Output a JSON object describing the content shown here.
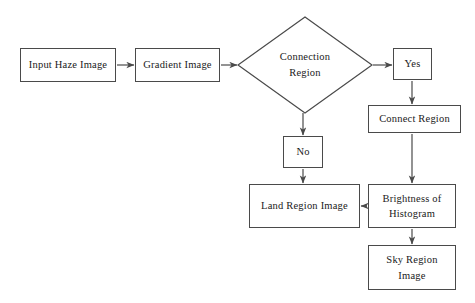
{
  "diagram": {
    "stroke_color": "#4a4a4a",
    "text_color": "#1a1a1a",
    "background_color": "#ffffff",
    "nodes": [
      {
        "id": "input_haze_image",
        "label": "Input Haze Image",
        "shape": "rect",
        "x": 20,
        "y": 48,
        "w": 96,
        "h": 34
      },
      {
        "id": "gradient_image",
        "label": "Gradient Image",
        "shape": "rect",
        "x": 135,
        "y": 48,
        "w": 85,
        "h": 34
      },
      {
        "id": "connection_region",
        "label": "Connection\nRegion",
        "shape": "diamond",
        "x": 238,
        "y": 17,
        "w": 134,
        "h": 96
      },
      {
        "id": "yes",
        "label": "Yes",
        "shape": "rect",
        "x": 393,
        "y": 48,
        "w": 39,
        "h": 32
      },
      {
        "id": "no",
        "label": "No",
        "shape": "rect",
        "x": 283,
        "y": 136,
        "w": 40,
        "h": 32
      },
      {
        "id": "connect_region",
        "label": "Connect Region",
        "shape": "rect",
        "x": 368,
        "y": 105,
        "w": 93,
        "h": 28
      },
      {
        "id": "land_region_image",
        "label": "Land Region Image",
        "shape": "rect",
        "x": 249,
        "y": 184,
        "w": 111,
        "h": 44
      },
      {
        "id": "brightness_of_histogram",
        "label": "Brightness of\nHistogram",
        "shape": "rect",
        "x": 368,
        "y": 184,
        "w": 88,
        "h": 44
      },
      {
        "id": "sky_region_image",
        "label": "Sky Region\nImage",
        "shape": "rect",
        "x": 368,
        "y": 245,
        "w": 88,
        "h": 45
      }
    ],
    "edges": [
      {
        "id": "edge-input-to-gradient",
        "from": "input_haze_image",
        "to": "gradient_image",
        "direction": "right"
      },
      {
        "id": "edge-gradient-to-connection",
        "from": "gradient_image",
        "to": "connection_region",
        "direction": "right"
      },
      {
        "id": "edge-connection-to-yes",
        "from": "connection_region",
        "to": "yes",
        "direction": "right",
        "label": ""
      },
      {
        "id": "edge-connection-to-no",
        "from": "connection_region",
        "to": "no",
        "direction": "down",
        "label": ""
      },
      {
        "id": "edge-yes-to-connect-region",
        "from": "yes",
        "to": "connect_region",
        "direction": "down"
      },
      {
        "id": "edge-connect-region-to-brightness",
        "from": "connect_region",
        "to": "brightness_of_histogram",
        "direction": "down"
      },
      {
        "id": "edge-no-to-land-region",
        "from": "no",
        "to": "land_region_image",
        "direction": "down"
      },
      {
        "id": "edge-brightness-to-land-region",
        "from": "brightness_of_histogram",
        "to": "land_region_image",
        "direction": "left"
      },
      {
        "id": "edge-brightness-to-sky-region",
        "from": "brightness_of_histogram",
        "to": "sky_region_image",
        "direction": "down"
      }
    ]
  }
}
